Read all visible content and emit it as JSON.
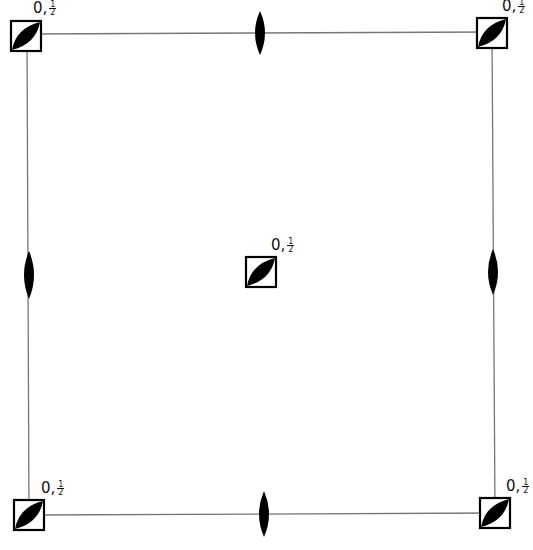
{
  "diagram": {
    "type": "symmetry-element-diagram",
    "colors": {
      "line": "#777777",
      "symbol": "#000000",
      "background": "#ffffff"
    },
    "frame": {
      "left": 28,
      "top": 34,
      "right": 493,
      "bottom": 514
    },
    "fourfold_axes": [
      {
        "id": "top-left",
        "cx": 26,
        "cy": 36,
        "label": {
          "prefix": "0,",
          "num": "1",
          "den": "2"
        }
      },
      {
        "id": "top-right",
        "cx": 492,
        "cy": 33,
        "label": {
          "prefix": "0,",
          "num": "1",
          "den": "2"
        }
      },
      {
        "id": "center",
        "cx": 261,
        "cy": 272,
        "label": {
          "prefix": "0,",
          "num": "1",
          "den": "2"
        }
      },
      {
        "id": "bottom-left",
        "cx": 29,
        "cy": 515,
        "label": {
          "prefix": "0,",
          "num": "1",
          "den": "2"
        }
      },
      {
        "id": "bottom-right",
        "cx": 495,
        "cy": 513,
        "label": {
          "prefix": "0,",
          "num": "1",
          "den": "2"
        }
      }
    ],
    "twofold_axes": [
      {
        "id": "top-edge",
        "cx": 260,
        "cy": 33,
        "orientation": "vertical"
      },
      {
        "id": "bottom-edge",
        "cx": 264,
        "cy": 514,
        "orientation": "vertical"
      },
      {
        "id": "left-edge",
        "cx": 29,
        "cy": 275,
        "orientation": "vertical"
      },
      {
        "id": "right-edge",
        "cx": 493,
        "cy": 272,
        "orientation": "vertical"
      }
    ]
  }
}
